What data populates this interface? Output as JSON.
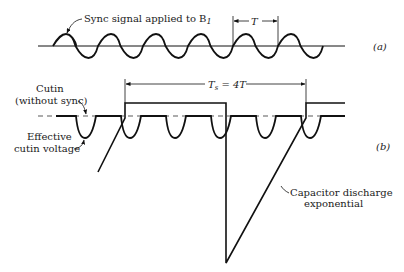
{
  "figure": {
    "panel_a": {
      "tag": "(a)",
      "sync_label": "Sync signal applied to B",
      "sync_label_subscript": "1",
      "period_label": "T"
    },
    "panel_b": {
      "tag": "(b)",
      "cutin_label_line1": "Cutin",
      "cutin_label_line2": "(without sync)",
      "effective_label_line1": "Effective",
      "effective_label_line2": "cutin voltage",
      "ts_label": "T",
      "ts_subscript": "s",
      "ts_equals": " = 4T",
      "discharge_label_line1": "Capacitor discharge",
      "discharge_label_line2": "exponential"
    },
    "colors": {
      "ink": "#111111",
      "background": "#ffffff"
    }
  }
}
